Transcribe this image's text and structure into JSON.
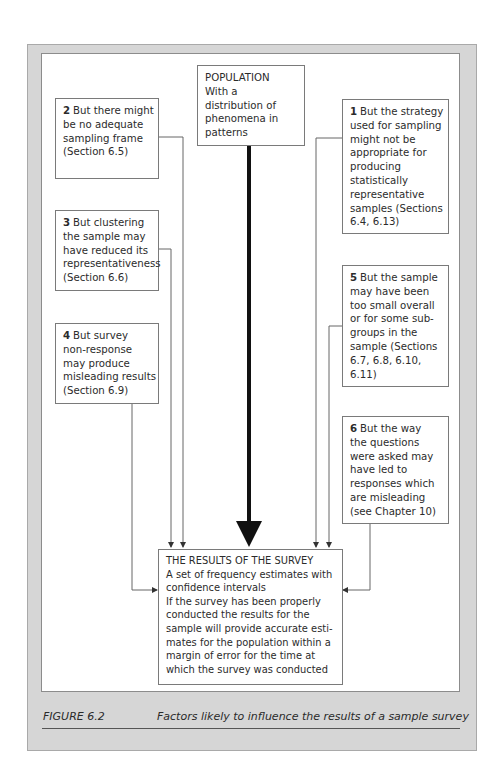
{
  "figure": {
    "number": "FIGURE 6.2",
    "caption": "Factors likely to influence the results of a sample survey"
  },
  "population_box": {
    "lines": [
      "POPULATION",
      "With a",
      "distribution of",
      "phenomena in",
      "patterns"
    ]
  },
  "factors": [
    {
      "num": "1",
      "lines": [
        "But the strategy",
        "used for sampling",
        "might not be",
        "appropriate for",
        "producing",
        "statistically",
        "representative",
        "samples (Sections",
        "6.4, 6.13)"
      ]
    },
    {
      "num": "2",
      "lines": [
        "But there might",
        "be no adequate",
        "sampling frame",
        "(Section 6.5)"
      ]
    },
    {
      "num": "3",
      "lines": [
        "But clustering",
        "the sample may",
        "have reduced its",
        "representativeness",
        "(Section 6.6)"
      ]
    },
    {
      "num": "4",
      "lines": [
        "But survey",
        "non-response",
        "may produce",
        "misleading results",
        "(Section 6.9)"
      ]
    },
    {
      "num": "5",
      "lines": [
        "But the sample",
        "may have been",
        "too small overall",
        "or for some sub-",
        "groups in the",
        "sample (Sections",
        "6.7, 6.8, 6.10,",
        "6.11)"
      ]
    },
    {
      "num": "6",
      "lines": [
        "But the way",
        "the questions",
        "were asked may",
        "have led to",
        "responses which",
        "are misleading",
        "(see Chapter 10)"
      ]
    }
  ],
  "results_box": {
    "lines": [
      "THE RESULTS OF THE SURVEY",
      "A set of frequency estimates with",
      "confidence intervals",
      "If the survey has been properly",
      "conducted the results for the",
      "sample will provide accurate esti-",
      "mates for the population within a",
      "margin of error for the time at",
      "which the survey was conducted"
    ]
  },
  "colors": {
    "frame": "#d6d6d6",
    "line": "#555555",
    "main_arrow": "#111111"
  }
}
